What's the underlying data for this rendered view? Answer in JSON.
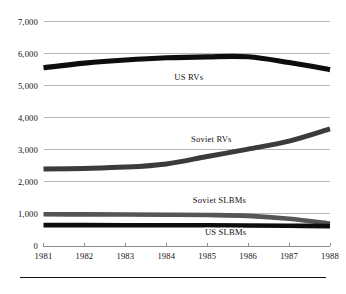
{
  "chart_data": {
    "type": "line",
    "title": "",
    "subtitle": "",
    "xlabel": "",
    "ylabel": "",
    "x": [
      1981,
      1982,
      1983,
      1984,
      1985,
      1986,
      1987,
      1988
    ],
    "xtick_labels": [
      "1981",
      "1982",
      "1983",
      "1984",
      "1985",
      "1986",
      "1987",
      "1988"
    ],
    "ytick_labels": [
      "0",
      "1,000",
      "2,000",
      "3,000",
      "4,000",
      "5,000",
      "6,000",
      "7,000"
    ],
    "ytick_values": [
      0,
      1000,
      2000,
      3000,
      4000,
      5000,
      6000,
      7000
    ],
    "ylim": [
      0,
      7000
    ],
    "xlim": [
      1981,
      1988
    ],
    "grid": true,
    "legend_position": "inline-annotations",
    "series": [
      {
        "name": "US RVs",
        "label": "US RVs",
        "color": "#0d0d0d",
        "stroke_width": 5.2,
        "label_x": 1984.55,
        "label_y": 5180,
        "values": [
          5560,
          5700,
          5800,
          5870,
          5900,
          5900,
          5720,
          5500
        ]
      },
      {
        "name": "Soviet RVs",
        "label": "Soviet RVs",
        "color": "#3b3b3b",
        "stroke_width": 5.0,
        "label_x": 1985.1,
        "label_y": 3250,
        "values": [
          2400,
          2420,
          2460,
          2560,
          2790,
          3020,
          3270,
          3650
        ]
      },
      {
        "name": "Soviet SLBMs",
        "label": "Soviet SLBMs",
        "color": "#555555",
        "stroke_width": 4.6,
        "label_x": 1985.3,
        "label_y": 1330,
        "values": [
          990,
          985,
          980,
          975,
          965,
          940,
          850,
          700
        ]
      },
      {
        "name": "US SLBMs",
        "label": "US SLBMs",
        "color": "#0d0d0d",
        "stroke_width": 4.6,
        "label_x": 1985.45,
        "label_y": 330,
        "values": [
          650,
          650,
          648,
          645,
          645,
          640,
          632,
          620
        ]
      }
    ]
  }
}
